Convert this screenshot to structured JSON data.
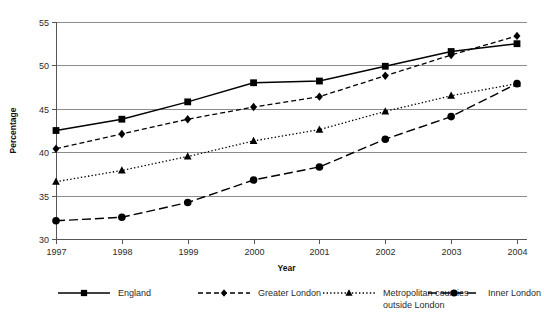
{
  "chart_data": {
    "type": "line",
    "title": "",
    "xlabel": "Year",
    "ylabel": "Percentage",
    "categories": [
      "1997",
      "1998",
      "1999",
      "2000",
      "2001",
      "2002",
      "2003",
      "2004"
    ],
    "x": [
      1997,
      1998,
      1999,
      2000,
      2001,
      2002,
      2003,
      2004
    ],
    "xlim": [
      1997,
      2004
    ],
    "ylim": [
      30,
      55
    ],
    "yticks": [
      30,
      35,
      40,
      45,
      50,
      55
    ],
    "ytick_labels": [
      "30",
      "35",
      "40",
      "45",
      "50",
      "55"
    ],
    "xtick_labels": [
      "1997",
      "1998",
      "1999",
      "2000",
      "2001",
      "2002",
      "2003",
      "2004"
    ],
    "grid": "horizontal",
    "legend_position": "bottom",
    "series": [
      {
        "name": "England",
        "marker": "square",
        "line_style": "solid",
        "color": "#000000",
        "values": [
          42.5,
          43.8,
          45.8,
          48.0,
          48.2,
          49.9,
          51.6,
          52.5
        ]
      },
      {
        "name": "Greater London",
        "marker": "diamond",
        "line_style": "dashed",
        "color": "#000000",
        "values": [
          40.4,
          42.1,
          43.8,
          45.2,
          46.4,
          48.8,
          51.2,
          53.4
        ]
      },
      {
        "name": "Metropolitan counties outside London",
        "marker": "triangle",
        "line_style": "dotted",
        "color": "#000000",
        "values": [
          36.6,
          37.9,
          39.5,
          41.3,
          42.6,
          44.7,
          46.5,
          47.9
        ]
      },
      {
        "name": "Inner London",
        "marker": "circle",
        "line_style": "long-dash",
        "color": "#000000",
        "values": [
          32.1,
          32.5,
          34.2,
          36.8,
          38.3,
          41.5,
          44.1,
          47.9
        ]
      }
    ]
  },
  "legend": {
    "entries": [
      {
        "label": "England",
        "line1": "England",
        "line2": ""
      },
      {
        "label": "Greater London",
        "line1": "Greater London",
        "line2": ""
      },
      {
        "label": "Metropolitan counties outside London",
        "line1": "Metropolitan counties",
        "line2": "outside London"
      },
      {
        "label": "Inner London",
        "line1": "Inner London",
        "line2": ""
      }
    ]
  }
}
